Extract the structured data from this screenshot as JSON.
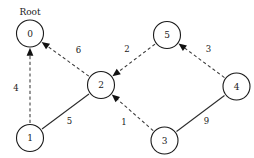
{
  "diagram": {
    "root_caption": "Root",
    "background_color": "#ffffff",
    "stroke_color": "#1a1a1a",
    "node_fill_color": "#ffffff",
    "node_radius": 13.5,
    "nodes": [
      {
        "id": "0",
        "label": "0",
        "cx": 30,
        "cy": 33.5,
        "is_root": true
      },
      {
        "id": "1",
        "label": "1",
        "cx": 30,
        "cy": 138,
        "is_root": false
      },
      {
        "id": "2",
        "label": "2",
        "cx": 101,
        "cy": 85,
        "is_root": false
      },
      {
        "id": "3",
        "label": "3",
        "cx": 164.5,
        "cy": 140.5,
        "is_root": false
      },
      {
        "id": "4",
        "label": "4",
        "cx": 236.5,
        "cy": 86.5,
        "is_root": false
      },
      {
        "id": "5",
        "label": "5",
        "cx": 167,
        "cy": 35,
        "is_root": false
      }
    ],
    "edges": [
      {
        "id": "e-1-0",
        "from": "1",
        "to": "0",
        "weight": "4",
        "style": "dashed",
        "directed": true,
        "label_x": 16,
        "label_y": 88.5
      },
      {
        "id": "e-2-0",
        "from": "2",
        "to": "0",
        "weight": "6",
        "style": "dashed",
        "directed": true,
        "label_x": 78.5,
        "label_y": 50
      },
      {
        "id": "e-1-2",
        "from": "1",
        "to": "2",
        "weight": "5",
        "style": "solid",
        "directed": false,
        "label_x": 69.5,
        "label_y": 121.5
      },
      {
        "id": "e-5-2",
        "from": "5",
        "to": "2",
        "weight": "2",
        "style": "dashed",
        "directed": true,
        "label_x": 127,
        "label_y": 49.5
      },
      {
        "id": "e-3-2",
        "from": "3",
        "to": "2",
        "weight": "1",
        "style": "dashed",
        "directed": true,
        "label_x": 124,
        "label_y": 122
      },
      {
        "id": "e-4-5",
        "from": "4",
        "to": "5",
        "weight": "3",
        "style": "dashed",
        "directed": true,
        "label_x": 208.5,
        "label_y": 49.5
      },
      {
        "id": "e-3-4",
        "from": "3",
        "to": "4",
        "weight": "9",
        "style": "solid",
        "directed": false,
        "label_x": 206.5,
        "label_y": 121
      }
    ]
  }
}
